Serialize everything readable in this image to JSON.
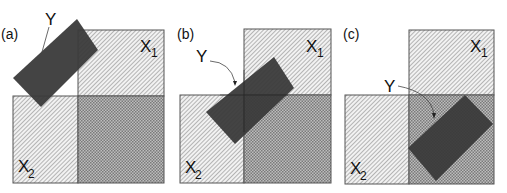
{
  "figure": {
    "panels": [
      {
        "id": "a",
        "label": "(a)",
        "y_label": "Y",
        "x1_label": "X",
        "x1_sub": "1",
        "x2_label": "X",
        "x2_sub": "2"
      },
      {
        "id": "b",
        "label": "(b)",
        "y_label": "Y",
        "x1_label": "X",
        "x1_sub": "1",
        "x2_label": "X",
        "x2_sub": "2"
      },
      {
        "id": "c",
        "label": "(c)",
        "y_label": "Y",
        "x1_label": "X",
        "x1_sub": "1",
        "x2_label": "X",
        "x2_sub": "2"
      }
    ],
    "colors": {
      "y_fill": "#3a3a3a",
      "hatch": "#8a8a8a",
      "overlap": "#9a9a9a",
      "border": "#555555"
    }
  }
}
